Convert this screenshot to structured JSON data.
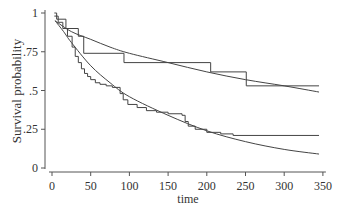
{
  "chart_data": {
    "type": "line",
    "title": "",
    "xlabel": "time",
    "ylabel": "Survival probability",
    "xlim": [
      0,
      350
    ],
    "ylim": [
      0,
      1
    ],
    "grid": false,
    "legend": null,
    "x_ticks": [
      0,
      50,
      100,
      150,
      200,
      250,
      300,
      350
    ],
    "x_tick_labels": [
      "0",
      "50",
      "100",
      "150",
      "200",
      "250",
      "300",
      "350"
    ],
    "y_ticks": [
      0,
      0.25,
      0.5,
      0.75,
      1
    ],
    "y_tick_labels": [
      "0",
      ".25",
      ".5",
      ".75",
      "1"
    ],
    "series": [
      {
        "name": "Kaplan-Meier (group 1)",
        "style": "step",
        "points": [
          [
            3,
            1.0
          ],
          [
            6,
            0.96
          ],
          [
            18,
            0.9
          ],
          [
            34,
            0.85
          ],
          [
            41,
            0.74
          ],
          [
            93,
            0.68
          ],
          [
            205,
            0.62
          ],
          [
            251,
            0.53
          ],
          [
            345,
            0.53
          ]
        ]
      },
      {
        "name": "Fitted survival (group 1)",
        "style": "smooth",
        "points": [
          [
            4,
            0.95
          ],
          [
            25,
            0.88
          ],
          [
            50,
            0.83
          ],
          [
            75,
            0.78
          ],
          [
            100,
            0.74
          ],
          [
            150,
            0.68
          ],
          [
            200,
            0.62
          ],
          [
            250,
            0.57
          ],
          [
            300,
            0.53
          ],
          [
            345,
            0.49
          ]
        ]
      },
      {
        "name": "Kaplan-Meier (group 2)",
        "style": "step",
        "points": [
          [
            3,
            0.98
          ],
          [
            8,
            0.94
          ],
          [
            14,
            0.9
          ],
          [
            20,
            0.85
          ],
          [
            26,
            0.78
          ],
          [
            30,
            0.72
          ],
          [
            34,
            0.68
          ],
          [
            38,
            0.64
          ],
          [
            42,
            0.61
          ],
          [
            46,
            0.59
          ],
          [
            50,
            0.57
          ],
          [
            56,
            0.55
          ],
          [
            62,
            0.54
          ],
          [
            70,
            0.53
          ],
          [
            78,
            0.52
          ],
          [
            88,
            0.48
          ],
          [
            92,
            0.44
          ],
          [
            98,
            0.41
          ],
          [
            110,
            0.39
          ],
          [
            122,
            0.37
          ],
          [
            135,
            0.36
          ],
          [
            150,
            0.35
          ],
          [
            168,
            0.34
          ],
          [
            172,
            0.3
          ],
          [
            176,
            0.27
          ],
          [
            185,
            0.25
          ],
          [
            200,
            0.23
          ],
          [
            218,
            0.22
          ],
          [
            234,
            0.21
          ],
          [
            345,
            0.21
          ]
        ]
      },
      {
        "name": "Fitted survival (group 2)",
        "style": "smooth",
        "points": [
          [
            4,
            0.95
          ],
          [
            15,
            0.88
          ],
          [
            25,
            0.81
          ],
          [
            50,
            0.66
          ],
          [
            75,
            0.55
          ],
          [
            100,
            0.46
          ],
          [
            150,
            0.34
          ],
          [
            200,
            0.24
          ],
          [
            250,
            0.17
          ],
          [
            300,
            0.12
          ],
          [
            345,
            0.09
          ]
        ]
      }
    ]
  }
}
